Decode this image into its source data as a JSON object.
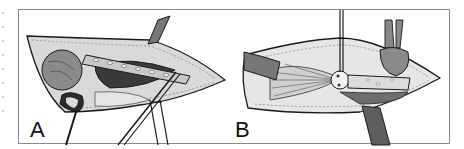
{
  "figure": {
    "panels": [
      {
        "id": "A",
        "label": "A",
        "description": "Surgical field with perforated plate and retractors (panel A)"
      },
      {
        "id": "B",
        "label": "B",
        "description": "Surgical field with fan-shaped tissue, strip and retractors (panel B)"
      }
    ],
    "colors": {
      "frame": "#8a8a8a",
      "line": "#1a1a1a",
      "tissue_dark": "#6e6e6e",
      "tissue_mid": "#a8a8a8",
      "tissue_light": "#d6d6d6",
      "background": "#ffffff"
    }
  }
}
